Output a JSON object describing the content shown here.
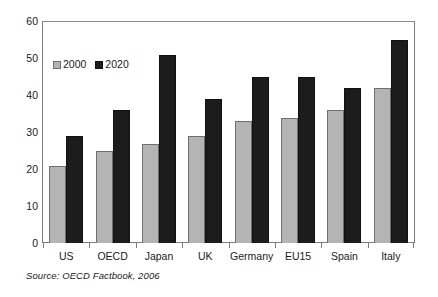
{
  "chart_data": {
    "type": "bar",
    "title": "",
    "subtitle": "",
    "xlabel": "",
    "ylabel": "",
    "ylim": [
      0,
      60
    ],
    "ytick_step": 10,
    "yticks": [
      0,
      10,
      20,
      30,
      40,
      50,
      60
    ],
    "grid": false,
    "legend_position": "top-left inside plot",
    "categories": [
      "US",
      "OECD",
      "Japan",
      "UK",
      "Germany",
      "EU15",
      "Spain",
      "Italy"
    ],
    "series": [
      {
        "name": "2000",
        "color": "#b4b4b4",
        "values": [
          21,
          25,
          27,
          29,
          33,
          34,
          36,
          42
        ]
      },
      {
        "name": "2020",
        "color": "#1c1c1c",
        "values": [
          29,
          36,
          51,
          39,
          45,
          45,
          42,
          55
        ]
      }
    ],
    "annotations": [
      "Source: OECD Factbook, 2006"
    ]
  },
  "legend": {
    "items": [
      {
        "label": "2000",
        "swatch": "legend-swatch-2000"
      },
      {
        "label": "2020",
        "swatch": "legend-swatch-2020"
      }
    ]
  },
  "axes": {
    "y": {
      "ticks": [
        "60",
        "50",
        "40",
        "30",
        "20",
        "10",
        "0"
      ]
    },
    "x": {
      "ticks": [
        "US",
        "OECD",
        "Japan",
        "UK",
        "Germany",
        "EU15",
        "Spain",
        "Italy"
      ]
    }
  },
  "source": {
    "text": "Source:  OECD Factbook, 2006"
  }
}
